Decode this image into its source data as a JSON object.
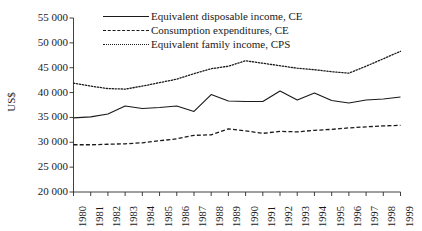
{
  "chart_data": {
    "type": "line",
    "title": "",
    "xlabel": "",
    "ylabel": "US$",
    "ylim": [
      20000,
      55000
    ],
    "yticks": [
      "20 000",
      "25 000",
      "30 000",
      "35 000",
      "40 000",
      "45 000",
      "50 000",
      "55 000"
    ],
    "ytick_values": [
      20000,
      25000,
      30000,
      35000,
      40000,
      45000,
      50000,
      55000
    ],
    "grid": false,
    "legend_position": "top-center",
    "categories": [
      "1980",
      "1981",
      "1982",
      "1983",
      "1984",
      "1985",
      "1986",
      "1987",
      "1988",
      "1989",
      "1990",
      "1991",
      "1992",
      "1993",
      "1994",
      "1995",
      "1996",
      "1997",
      "1998",
      "1999"
    ],
    "x": [
      1980,
      1981,
      1982,
      1983,
      1984,
      1985,
      1986,
      1987,
      1988,
      1989,
      1990,
      1991,
      1992,
      1993,
      1994,
      1995,
      1996,
      1997,
      1998,
      1999
    ],
    "series": [
      {
        "name": "Equivalent disposable income, CE",
        "style": "solid",
        "values": [
          34900,
          35100,
          35700,
          37300,
          36800,
          37000,
          37300,
          36200,
          39600,
          38300,
          38200,
          38200,
          40300,
          38500,
          39900,
          38400,
          37900,
          38500,
          38700,
          39100
        ]
      },
      {
        "name": "Consumption expenditures, CE",
        "style": "dashed",
        "values": [
          29500,
          29500,
          29600,
          29700,
          29900,
          30300,
          30700,
          31400,
          31500,
          32700,
          32300,
          31800,
          32200,
          32100,
          32400,
          32600,
          32900,
          33100,
          33300,
          33400
        ]
      },
      {
        "name": "Equivalent family income, CPS",
        "style": "dotted",
        "values": [
          41900,
          41300,
          40800,
          40700,
          41300,
          42000,
          42700,
          43800,
          44800,
          45300,
          46400,
          45900,
          45400,
          44900,
          44600,
          44200,
          43900,
          45300,
          46800,
          48300
        ]
      }
    ],
    "series_extra_note": ""
  },
  "legend": {
    "items": [
      {
        "label": "Equivalent disposable income, CE",
        "style": "solid"
      },
      {
        "label": "Consumption expenditures, CE",
        "style": "dashed"
      },
      {
        "label": "Equivalent family income, CPS",
        "style": "dotted"
      }
    ]
  }
}
